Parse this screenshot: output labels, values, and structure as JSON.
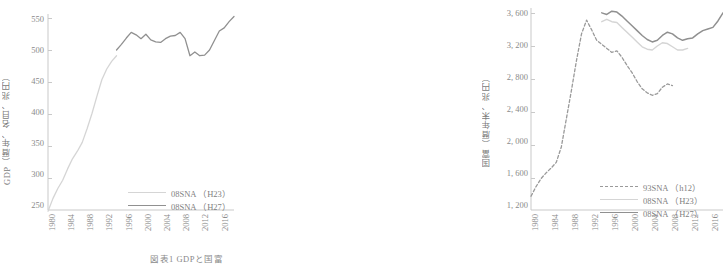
{
  "caption": "図表1  GDPと国富",
  "colors": {
    "axis": "#c9c9c9",
    "tick_text": "#8a8a8a",
    "series_h23": "#d5d5d5",
    "series_h27": "#909090",
    "series_h12": "#9a9a9a"
  },
  "chart_data": [
    {
      "type": "line",
      "id": "gdp",
      "title": "",
      "ylabel": "GDP（暦年、名目、兆円）",
      "xlabel": "",
      "ylim": [
        250,
        560
      ],
      "yticks": [
        250,
        300,
        350,
        400,
        450,
        500,
        550
      ],
      "ytick_labels": [
        "250",
        "300",
        "350",
        "400",
        "450",
        "500",
        "550"
      ],
      "xlim": [
        1980,
        2018
      ],
      "xticks": [
        1980,
        1984,
        1988,
        1992,
        1996,
        2000,
        2004,
        2008,
        2012,
        2016
      ],
      "xtick_labels": [
        "1980",
        "1984",
        "1988",
        "1992",
        "1996",
        "2000",
        "2004",
        "2008",
        "2012",
        "2016"
      ],
      "grid": false,
      "legend_position": "lower-right",
      "series": [
        {
          "name": "08SNA （H23）",
          "style": "solid",
          "color": "#d5d5d5",
          "x": [
            1980,
            1981,
            1982,
            1983,
            1984,
            1985,
            1986,
            1987,
            1988,
            1989,
            1990,
            1991,
            1992,
            1993,
            1994
          ],
          "values": [
            248,
            268,
            284,
            297,
            315,
            331,
            343,
            357,
            379,
            403,
            430,
            456,
            473,
            485,
            494
          ]
        },
        {
          "name": "08SNA （H27）",
          "style": "solid",
          "color": "#909090",
          "x": [
            1994,
            1995,
            1996,
            1997,
            1998,
            1999,
            2000,
            2001,
            2002,
            2003,
            2004,
            2005,
            2006,
            2007,
            2008,
            2009,
            2010,
            2011,
            2012,
            2013,
            2014,
            2015,
            2016,
            2017,
            2018
          ],
          "values": [
            503,
            512,
            522,
            531,
            527,
            521,
            528,
            519,
            516,
            515,
            521,
            525,
            526,
            531,
            521,
            494,
            500,
            494,
            495,
            503,
            518,
            533,
            538,
            548,
            556
          ]
        }
      ]
    },
    {
      "type": "line",
      "id": "national-wealth",
      "title": "",
      "ylabel": "国富（暦年末、兆円）",
      "xlabel": "",
      "ylim": [
        1200,
        3700
      ],
      "yticks": [
        1200,
        1600,
        2000,
        2400,
        2800,
        3200,
        3600
      ],
      "ytick_labels": [
        "1, 200",
        "1, 600",
        "2, 000",
        "2, 400",
        "2, 800",
        "3, 200",
        "3, 600"
      ],
      "xlim": [
        1980,
        2018
      ],
      "xticks": [
        1980,
        1984,
        1988,
        1992,
        1996,
        2000,
        2004,
        2008,
        2012,
        2016
      ],
      "xtick_labels": [
        "1980",
        "1984",
        "1988",
        "1992",
        "1996",
        "2000",
        "2004",
        "2008",
        "2012",
        "2016"
      ],
      "grid": false,
      "legend_position": "lower-right",
      "series": [
        {
          "name": "93SNA （h12）",
          "style": "dashed",
          "color": "#9a9a9a",
          "x": [
            1980,
            1981,
            1982,
            1983,
            1984,
            1985,
            1986,
            1987,
            1988,
            1989,
            1990,
            1991,
            1992,
            1993,
            1994,
            1995,
            1996,
            1997,
            1998,
            1999,
            2000,
            2001,
            2002,
            2003,
            2004,
            2005,
            2006,
            2007,
            2008
          ],
          "values": [
            1370,
            1490,
            1590,
            1660,
            1720,
            1790,
            1980,
            2330,
            2680,
            3050,
            3380,
            3550,
            3430,
            3300,
            3250,
            3200,
            3150,
            3170,
            3090,
            2990,
            2900,
            2790,
            2700,
            2650,
            2620,
            2640,
            2720,
            2760,
            2740
          ]
        },
        {
          "name": "08SNA （H23）",
          "style": "solid",
          "color": "#d5d5d5",
          "x": [
            1994,
            1995,
            1996,
            1997,
            1998,
            1999,
            2000,
            2001,
            2002,
            2003,
            2004,
            2005,
            2006,
            2007,
            2008,
            2009,
            2010,
            2011
          ],
          "values": [
            3530,
            3560,
            3530,
            3520,
            3460,
            3400,
            3340,
            3280,
            3220,
            3190,
            3180,
            3230,
            3270,
            3260,
            3220,
            3180,
            3180,
            3200
          ]
        },
        {
          "name": "08SNA （H27）",
          "style": "solid",
          "color": "#909090",
          "x": [
            1994,
            1995,
            1996,
            1997,
            1998,
            1999,
            2000,
            2001,
            2002,
            2003,
            2004,
            2005,
            2006,
            2007,
            2008,
            2009,
            2010,
            2011,
            2012,
            2013,
            2014,
            2015,
            2016,
            2017,
            2018
          ],
          "values": [
            3640,
            3620,
            3660,
            3650,
            3600,
            3540,
            3480,
            3420,
            3360,
            3310,
            3280,
            3300,
            3360,
            3400,
            3380,
            3330,
            3300,
            3320,
            3330,
            3380,
            3420,
            3440,
            3460,
            3540,
            3640
          ]
        }
      ]
    }
  ]
}
